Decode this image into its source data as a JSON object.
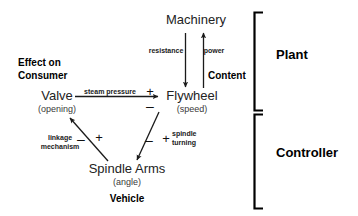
{
  "diagram": {
    "title_none": "",
    "nodes": [
      {
        "id": "machinery",
        "name": "Machinery",
        "sub": ""
      },
      {
        "id": "valve",
        "name": "Valve",
        "sub": "(opening)"
      },
      {
        "id": "flywheel",
        "name": "Flywheel",
        "sub": "(speed)"
      },
      {
        "id": "spindle_arms",
        "name": "Spindle Arms",
        "sub": "(angle)"
      }
    ],
    "edges": [
      {
        "id": "resistance",
        "label": "resistance",
        "from": "machinery",
        "to": "flywheel",
        "direction": "down",
        "signs": []
      },
      {
        "id": "power",
        "label": "power",
        "from": "flywheel",
        "to": "machinery",
        "direction": "up",
        "signs": []
      },
      {
        "id": "steam_pressure",
        "label": "steam pressure",
        "from": "valve",
        "to": "flywheel",
        "direction": "right",
        "signs": [
          "+",
          "–"
        ]
      },
      {
        "id": "linkage_mechanism",
        "label_line1": "linkage",
        "label_line2": "mechanism",
        "from": "spindle_arms",
        "to": "valve",
        "direction": "up-left",
        "signs": [
          "–",
          "+"
        ]
      },
      {
        "id": "spindle_turning",
        "label_line1": "spindle",
        "label_line2": "turning",
        "from": "flywheel",
        "to": "spindle_arms",
        "direction": "down-left",
        "signs": [
          "–",
          "+"
        ]
      }
    ],
    "annotations": {
      "effect_on_consumer_line1": "Effect on",
      "effect_on_consumer_line2": "Consumer",
      "content": "Content",
      "vehicle": "Vehicle"
    },
    "brackets": [
      {
        "id": "plant",
        "label": "Plant"
      },
      {
        "id": "controller",
        "label": "Controller"
      }
    ],
    "colors": {
      "background": "#ffffff",
      "stroke": "#1a1a1a",
      "text": "#1a1a1a",
      "bold_text": "#000000"
    }
  }
}
